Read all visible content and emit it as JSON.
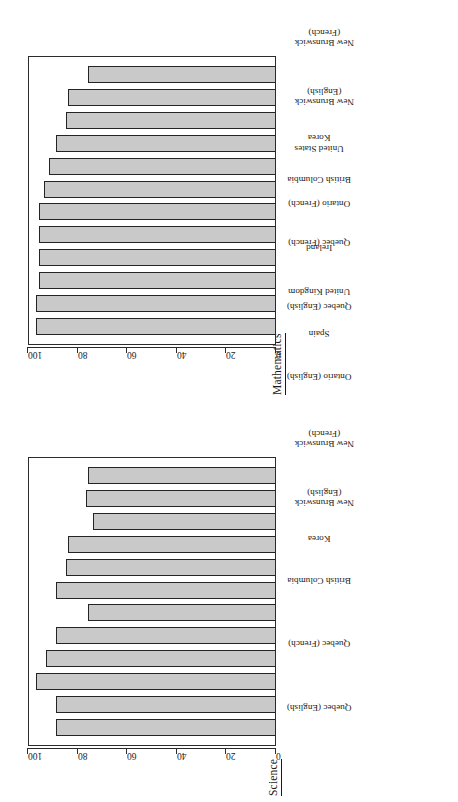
{
  "document": {
    "orientation": "rotated-90-ccw",
    "background": "#ffffff",
    "ink": "#1a1a1a"
  },
  "style": {
    "bar_fill": "#c9c9c9",
    "bar_stroke": "#242424",
    "frame_stroke": "#2b2b2b"
  },
  "panels": [
    {
      "id": "science",
      "title": "Science"
    },
    {
      "id": "mathematics",
      "title": "Mathematics"
    }
  ],
  "axis": {
    "ticks": [
      "0",
      "20",
      "40",
      "60",
      "80",
      "100"
    ],
    "min": 0,
    "max": 100
  },
  "chart_data": [
    {
      "type": "bar",
      "title": "Science",
      "xlabel": "",
      "ylabel": "",
      "ylim": [
        0,
        100
      ],
      "grid": false,
      "legend": "none",
      "categories": [
        "Quebec (English)",
        "Quebec (French)",
        "British Columbia",
        "Korea",
        "New Brunswick (English)",
        "New Brunswick (French)",
        "Ontario (English)",
        "Spain",
        "United Kingdom",
        "Ireland",
        "Ontario (French)",
        "United States"
      ],
      "values": [
        89,
        89,
        97,
        93,
        89,
        76,
        89,
        85,
        84,
        74,
        77,
        76
      ]
    },
    {
      "type": "bar",
      "title": "Mathematics",
      "xlabel": "",
      "ylabel": "",
      "ylim": [
        0,
        100
      ],
      "grid": false,
      "legend": "none",
      "categories": [
        "Quebec (English)",
        "Quebec (French)",
        "British Columbia",
        "Korea",
        "New Brunswick (English)",
        "New Brunswick (French)",
        "Ontario (English)",
        "Spain",
        "United Kingdom",
        "Ireland",
        "Ontario (French)",
        "United States"
      ],
      "values": [
        97,
        97,
        96,
        96,
        96,
        96,
        94,
        92,
        89,
        85,
        84,
        76
      ]
    }
  ],
  "labels_wrapped": {
    "New Brunswick (English)": [
      "New Brunswick",
      "(English)"
    ],
    "New Brunswick (French)": [
      "New Brunswick",
      "(French)"
    ]
  }
}
